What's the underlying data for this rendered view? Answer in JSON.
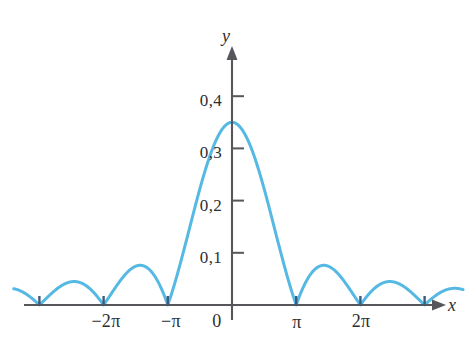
{
  "chart_data": {
    "type": "line",
    "title": "",
    "subtitle": "",
    "xlabel": "x",
    "ylabel": "y",
    "axis_origin_label": "0",
    "decimal_separator": ",",
    "grid": false,
    "legend": null,
    "curve_color": "#56b9e3",
    "axis_color": "#57565a",
    "text_color": "#2e2d31",
    "xlim": [
      -3.4,
      3.6
    ],
    "ylim": [
      0,
      0.47
    ],
    "xunit": "pi",
    "x_tick_labels": [
      "−2π",
      "−π",
      "0",
      "π",
      "2π"
    ],
    "x_tick_values": [
      -2,
      -1,
      0,
      1,
      2
    ],
    "y_tick_labels": [
      "0,1",
      "0,2",
      "0,3",
      "0,4"
    ],
    "y_tick_values": [
      0.1,
      0.2,
      0.3,
      0.4
    ],
    "series": [
      {
        "name": "|sin(x)/x| envelope",
        "description": "Absolute value of a sinc-like function; zeros at integer multiples of pi, lobe maxima decreasing outward",
        "zeros_at_pi_multiples": [
          -3,
          -2,
          -1,
          0,
          1,
          2,
          3
        ],
        "lobe_peaks": [
          {
            "x_pi": -2.46,
            "y": 0.12
          },
          {
            "x_pi": -1.43,
            "y": 0.2
          },
          {
            "x_pi": -0.45,
            "y": 0.35
          },
          {
            "x_pi": 0.45,
            "y": 0.35
          },
          {
            "x_pi": 1.43,
            "y": 0.2
          },
          {
            "x_pi": 2.46,
            "y": 0.12
          }
        ],
        "x": [
          -3.4,
          -3.3,
          -3.2,
          -3.1,
          -3.0,
          -2.9,
          -2.8,
          -2.7,
          -2.6,
          -2.5,
          -2.4,
          -2.3,
          -2.2,
          -2.1,
          -2.0,
          -1.9,
          -1.8,
          -1.7,
          -1.6,
          -1.5,
          -1.4,
          -1.3,
          -1.2,
          -1.1,
          -1.0,
          -0.9,
          -0.8,
          -0.7,
          -0.6,
          -0.5,
          -0.4,
          -0.3,
          -0.2,
          -0.1,
          0.0,
          0.1,
          0.2,
          0.3,
          0.4,
          0.5,
          0.6,
          0.7,
          0.8,
          0.9,
          1.0,
          1.1,
          1.2,
          1.3,
          1.4,
          1.5,
          1.6,
          1.7,
          1.8,
          1.9,
          2.0,
          2.1,
          2.2,
          2.3,
          2.4,
          2.5,
          2.6,
          2.7,
          2.8,
          2.9,
          3.0,
          3.1,
          3.2,
          3.3,
          3.4,
          3.5,
          3.6
        ],
        "y": [
          0.036,
          0.026,
          0.017,
          0.008,
          0.0,
          0.009,
          0.019,
          0.039,
          0.066,
          0.096,
          0.113,
          0.118,
          0.101,
          0.062,
          0.0,
          0.026,
          0.058,
          0.102,
          0.148,
          0.182,
          0.199,
          0.196,
          0.171,
          0.116,
          0.0,
          0.055,
          0.119,
          0.189,
          0.255,
          0.309,
          0.341,
          0.35,
          0.317,
          0.214,
          0.0,
          0.214,
          0.317,
          0.35,
          0.341,
          0.309,
          0.255,
          0.189,
          0.119,
          0.055,
          0.0,
          0.116,
          0.171,
          0.196,
          0.199,
          0.182,
          0.148,
          0.102,
          0.058,
          0.026,
          0.0,
          0.062,
          0.101,
          0.118,
          0.113,
          0.096,
          0.066,
          0.039,
          0.019,
          0.009,
          0.0,
          0.008,
          0.017,
          0.026,
          0.036,
          0.044,
          0.05
        ]
      }
    ]
  },
  "axes": {
    "x_axis_name": "x",
    "y_axis_name": "y",
    "origin_label": "0"
  },
  "x_ticks": [
    {
      "label": "−2π",
      "value": -2
    },
    {
      "label": "−π",
      "value": -1
    },
    {
      "label": "π",
      "value": 1
    },
    {
      "label": "2π",
      "value": 2
    }
  ],
  "y_ticks": [
    {
      "label": "0,4",
      "value": 0.4
    },
    {
      "label": "0,3",
      "value": 0.3
    },
    {
      "label": "0,2",
      "value": 0.2
    },
    {
      "label": "0,1",
      "value": 0.1
    }
  ]
}
